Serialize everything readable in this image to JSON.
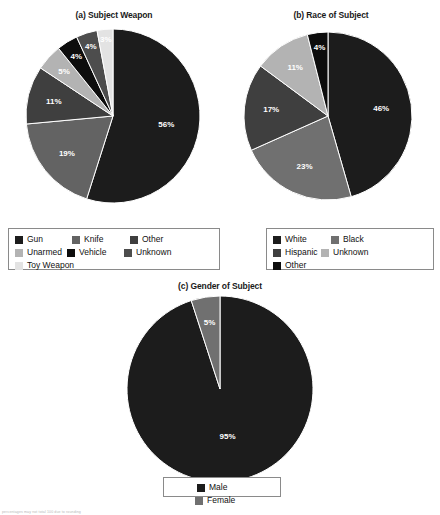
{
  "figure": {
    "footnote": "percentages may not total 100 due to rounding"
  },
  "chart_data": [
    {
      "type": "pie",
      "id": "subject-weapon",
      "title": "(a) Subject Weapon",
      "categories": [
        "Gun",
        "Knife",
        "Other",
        "Unarmed",
        "Vehicle",
        "Unknown",
        "Toy Weapon"
      ],
      "values": [
        56,
        19,
        11,
        5,
        4,
        4,
        3
      ],
      "labels": [
        "56%",
        "19%",
        "11%",
        "5%",
        "4%",
        "4%",
        "3%"
      ],
      "colors": [
        "#1c1c1c",
        "#636363",
        "#3f3f3f",
        "#b3b3b3",
        "#0d0d0d",
        "#4d4d4d",
        "#e3e3e3"
      ],
      "start_angle_deg": 0,
      "direction": "clockwise",
      "legend_position": "bottom",
      "legend_columns": 4
    },
    {
      "type": "pie",
      "id": "race-of-subject",
      "title": "(b) Race of Subject",
      "categories": [
        "White",
        "Black",
        "Hispanic",
        "Unknown",
        "Other"
      ],
      "values": [
        46,
        23,
        17,
        11,
        4
      ],
      "labels": [
        "46%",
        "23%",
        "17%",
        "11%",
        "4%"
      ],
      "colors": [
        "#1c1c1c",
        "#707070",
        "#3f3f3f",
        "#b3b3b3",
        "#0d0d0d"
      ],
      "start_angle_deg": 0,
      "direction": "clockwise",
      "legend_position": "bottom",
      "legend_columns": 3
    },
    {
      "type": "pie",
      "id": "gender-of-subject",
      "title": "(c) Gender of Subject",
      "categories": [
        "Male",
        "Female"
      ],
      "values": [
        95,
        5
      ],
      "labels": [
        "95%",
        "5%"
      ],
      "colors": [
        "#1c1c1c",
        "#707070"
      ],
      "start_angle_deg": 0,
      "direction": "clockwise",
      "legend_position": "bottom",
      "legend_columns": 2
    }
  ]
}
